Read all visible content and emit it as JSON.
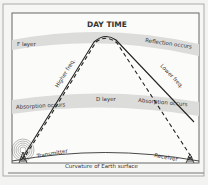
{
  "title": "DAY TIME",
  "layers": {
    "f_layer": {
      "label": "F layer",
      "note": "Reflection occurs"
    },
    "d_layer": {
      "label": "D layer",
      "note_left": "Absorption occurs",
      "note_right": "Absorption occurs"
    }
  },
  "paths": {
    "higher": {
      "label": "Higher freq."
    },
    "lower": {
      "label": "Lower freq."
    }
  },
  "stations": {
    "transmitter": {
      "label": "Transmitter"
    },
    "receiver": {
      "label": "Receiver"
    }
  },
  "earth": {
    "label": "Curvature of Earth surface"
  },
  "colors": {
    "background": "#f3f3f1",
    "panel": "#fafaf8",
    "band": "#d9d9d7",
    "line": "#222222",
    "frame": "#8a8a8a"
  }
}
